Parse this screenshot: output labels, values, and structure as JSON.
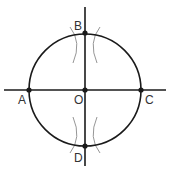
{
  "diagram": {
    "colors": {
      "background": "#ffffff",
      "stroke": "#1a1a1a",
      "arc_marks": "#8a8a8a",
      "label": "#333333"
    },
    "circle": {
      "cx": 85,
      "cy": 90,
      "r": 56
    },
    "axes": {
      "horizontal": {
        "x1": 4,
        "y1": 90,
        "x2": 166,
        "y2": 90
      },
      "vertical": {
        "x1": 85,
        "y1": 7,
        "x2": 85,
        "y2": 166
      }
    },
    "points": [
      {
        "id": "A",
        "label": "A",
        "x": 29,
        "y": 90,
        "label_x": 18,
        "label_y": 104
      },
      {
        "id": "O",
        "label": "O",
        "x": 85,
        "y": 90,
        "label_x": 74,
        "label_y": 104
      },
      {
        "id": "C",
        "label": "C",
        "x": 141,
        "y": 90,
        "label_x": 145,
        "label_y": 104
      },
      {
        "id": "B",
        "label": "B",
        "x": 85,
        "y": 33,
        "label_x": 74,
        "label_y": 30
      },
      {
        "id": "D",
        "label": "D",
        "x": 85,
        "y": 146,
        "label_x": 74,
        "label_y": 162
      }
    ],
    "arc_marks": [
      {
        "name": "arc-mark-top-left",
        "d": "M 70 27 Q 82 42 73 63"
      },
      {
        "name": "arc-mark-top-right",
        "d": "M 100 27 Q 88 42 97 63"
      },
      {
        "name": "arc-mark-bottom-left",
        "d": "M 73 117 Q 82 138 70 153"
      },
      {
        "name": "arc-mark-bottom-right",
        "d": "M 97 117 Q 88 138 100 153"
      }
    ]
  }
}
